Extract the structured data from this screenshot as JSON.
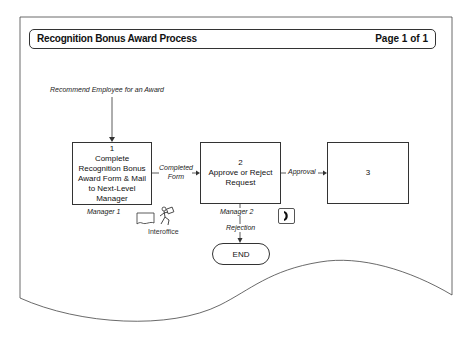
{
  "header": {
    "title": "Recognition Bonus Award Process",
    "page": "Page 1 of 1"
  },
  "start": {
    "label": "Recommend Employee for an Award"
  },
  "steps": [
    {
      "number": "1",
      "text": "Complete Recognition Bonus Award Form & Mail to Next-Level Manager",
      "role": "Manager 1"
    },
    {
      "number": "2",
      "text": "Approve or Reject Request",
      "role": "Manager 2"
    },
    {
      "number": "3",
      "text": ""
    }
  ],
  "connectors": {
    "step1_to_step2": "Completed Form",
    "step2_to_step3": "Approval",
    "step2_to_end": "Rejection"
  },
  "icons": {
    "form_icon": "form-icon",
    "courier_icon": "courier-icon",
    "courier_label": "Interoffice",
    "phone_icon": "phone-icon"
  },
  "end": {
    "label": "END"
  },
  "colors": {
    "line": "#333333",
    "text": "#111111"
  }
}
